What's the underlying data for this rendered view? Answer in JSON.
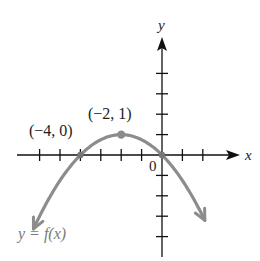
{
  "chart_data": {
    "type": "line",
    "title": "",
    "xlabel": "x",
    "ylabel": "y",
    "origin_label": "0",
    "curve_label": "y = f(x)",
    "function": "f(x) = -(1/4)(x+2)^2 + 1",
    "xlim": [
      -7,
      4
    ],
    "ylim": [
      -5,
      5
    ],
    "x_ticks": [
      -6,
      -5,
      -4,
      -3,
      -2,
      -1,
      1,
      2
    ],
    "y_ticks": [
      -4,
      -3,
      -2,
      -1,
      1,
      2,
      3,
      4
    ],
    "grid": false,
    "points": [
      {
        "x": -4,
        "y": 0,
        "label": "(−4, 0)"
      },
      {
        "x": -2,
        "y": 1,
        "label": "(−2, 1)"
      },
      {
        "x": 0,
        "y": 0,
        "label": ""
      }
    ],
    "series": [
      {
        "name": "y = f(x)",
        "x": [
          -6.3,
          -6,
          -5,
          -4,
          -3,
          -2,
          -1,
          0,
          1,
          2,
          2.1
        ],
        "values": [
          -3.62,
          -3,
          -1.25,
          0,
          0.75,
          1,
          0.75,
          0,
          -1.25,
          -3,
          -3.2
        ]
      }
    ],
    "colors": {
      "axes": "#111111",
      "curve": "#8c8c8c",
      "curve_label": "#7a7a7a"
    }
  }
}
